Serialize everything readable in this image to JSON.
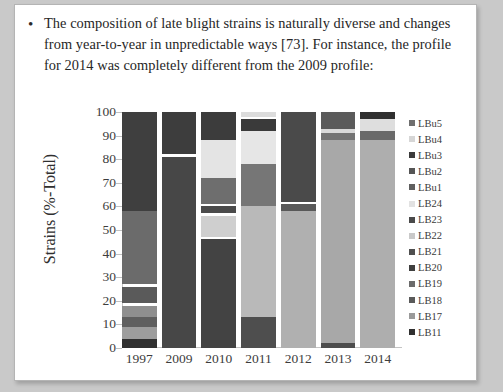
{
  "slide": {
    "bullet_marker": "•",
    "body_text": "The composition of late blight strains is naturally diverse and changes from year-to-year in unpredictable ways [73]. For instance, the profile for 2014 was completely different from the 2009 profile:"
  },
  "chart_data": {
    "type": "bar",
    "stacked": true,
    "stack_mode": "percent",
    "title": "",
    "xlabel": "",
    "ylabel": "Strains (%-Total)",
    "ylim": [
      0,
      100
    ],
    "ytick_labels": [
      "100",
      "90",
      "80",
      "70",
      "60",
      "50",
      "40",
      "30",
      "20",
      "10",
      "0"
    ],
    "yticks": [
      100,
      90,
      80,
      70,
      60,
      50,
      40,
      30,
      20,
      10,
      0
    ],
    "grid": false,
    "legend_position": "right",
    "categories": [
      "1997",
      "2009",
      "2010",
      "2011",
      "2012",
      "2013",
      "2014"
    ],
    "legend_entries": [
      "LBu5",
      "LBu4",
      "LBu3",
      "LBu2",
      "LBu1",
      "LB24",
      "LB23",
      "LB22",
      "LB21",
      "LB20",
      "LB19",
      "LB18",
      "LB17",
      "LB11"
    ],
    "series_colors": {
      "LBu5": "#6f6f6f",
      "LBu4": "#d6d6d6",
      "LBu3": "#3b3b3b",
      "LBu2": "#555555",
      "LBu1": "#5f5f5f",
      "LB24": "#e2e2e2",
      "LB23": "#4a4a4a",
      "LB22": "#c9c9c9",
      "LB21": "#4f4f4f",
      "LB20": "#3f3f3f",
      "LB19": "#6b6b6b",
      "LB18": "#5a5a5a",
      "LB17": "#9a9a9a",
      "LB11": "#303030"
    },
    "series": [
      {
        "name": "LBu5",
        "values": [
          0,
          0,
          0,
          0,
          0,
          9,
          0
        ]
      },
      {
        "name": "LBu4",
        "values": [
          0,
          0,
          0,
          0,
          0,
          0,
          6
        ]
      },
      {
        "name": "LBu3",
        "values": [
          0,
          0,
          0,
          4,
          0,
          0,
          2
        ]
      },
      {
        "name": "LBu2",
        "values": [
          0,
          0,
          0,
          0,
          0,
          0,
          3
        ]
      },
      {
        "name": "LBu1",
        "values": [
          0,
          0,
          12,
          0,
          0,
          0,
          0
        ]
      },
      {
        "name": "LB24",
        "values": [
          0,
          0,
          16,
          17,
          0,
          0,
          0
        ]
      },
      {
        "name": "LB23",
        "values": [
          42,
          18,
          0,
          0,
          42,
          0,
          0
        ]
      },
      {
        "name": "LB22",
        "values": [
          0,
          0,
          0,
          0,
          0,
          0,
          0
        ]
      },
      {
        "name": "LB21",
        "values": [
          0,
          0,
          12,
          17,
          0,
          0,
          0
        ]
      },
      {
        "name": "LB20",
        "values": [
          0,
          82,
          0,
          0,
          0,
          0,
          0
        ]
      },
      {
        "name": "LB19",
        "values": [
          31,
          0,
          0,
          0,
          0,
          0,
          0
        ]
      },
      {
        "name": "LB18",
        "values": [
          0,
          0,
          4,
          0,
          0,
          0,
          0
        ]
      },
      {
        "name": "LB17",
        "values": [
          22,
          0,
          10,
          49,
          58,
          90,
          89
        ]
      },
      {
        "name": "LB11",
        "values": [
          5,
          0,
          46,
          13,
          0,
          1,
          0
        ]
      }
    ],
    "bars": [
      {
        "category": "1997",
        "segments": [
          {
            "series": "LB23",
            "from": 58,
            "to": 100,
            "color": "#3f3f3f"
          },
          {
            "series": "LB19",
            "from": 27,
            "to": 58,
            "color": "#6b6b6b"
          },
          {
            "series": "LB17",
            "from": 19,
            "to": 26,
            "color": "#5a5a5a"
          },
          {
            "series": "LB17",
            "from": 13,
            "to": 18,
            "color": "#8f8f8f"
          },
          {
            "series": "LB17",
            "from": 9,
            "to": 13,
            "color": "#5f5f5f"
          },
          {
            "series": "LB17",
            "from": 4,
            "to": 9,
            "color": "#9d9d9d"
          },
          {
            "series": "LB11",
            "from": 0,
            "to": 4,
            "color": "#303030"
          }
        ]
      },
      {
        "category": "2009",
        "segments": [
          {
            "series": "LB23",
            "from": 82,
            "to": 100,
            "color": "#3d3d3d"
          },
          {
            "series": "LB20",
            "from": 0,
            "to": 81,
            "color": "#474747"
          }
        ]
      },
      {
        "category": "2010",
        "segments": [
          {
            "series": "LBu1",
            "from": 88,
            "to": 100,
            "color": "#3c3c3c"
          },
          {
            "series": "LB24",
            "from": 72,
            "to": 88,
            "color": "#e4e4e4"
          },
          {
            "series": "LB21",
            "from": 61,
            "to": 72,
            "color": "#6e6e6e"
          },
          {
            "series": "LB18",
            "from": 57,
            "to": 60,
            "color": "#4b4b4b"
          },
          {
            "series": "LB17",
            "from": 47,
            "to": 56,
            "color": "#cfcfcf"
          },
          {
            "series": "LB11",
            "from": 0,
            "to": 46,
            "color": "#434343"
          }
        ]
      },
      {
        "category": "2011",
        "segments": [
          {
            "series": "LB24",
            "from": 98,
            "to": 100,
            "color": "#dcdcdc"
          },
          {
            "series": "LBu3",
            "from": 92,
            "to": 97,
            "color": "#3a3a3a"
          },
          {
            "series": "LB24",
            "from": 78,
            "to": 92,
            "color": "#e6e6e6"
          },
          {
            "series": "LB21",
            "from": 60,
            "to": 78,
            "color": "#767676"
          },
          {
            "series": "LB17",
            "from": 13,
            "to": 60,
            "color": "#b9b9b9"
          },
          {
            "series": "LB11",
            "from": 0,
            "to": 13,
            "color": "#4e4e4e"
          }
        ]
      },
      {
        "category": "2012",
        "segments": [
          {
            "series": "LB23",
            "from": 62,
            "to": 100,
            "color": "#4a4a4a"
          },
          {
            "series": "LB23",
            "from": 58,
            "to": 61,
            "color": "#595959"
          },
          {
            "series": "LB17",
            "from": 0,
            "to": 58,
            "color": "#b0b0b0"
          }
        ]
      },
      {
        "category": "2013",
        "segments": [
          {
            "series": "LBu5",
            "from": 93,
            "to": 100,
            "color": "#5b5b5b"
          },
          {
            "series": "LBu5",
            "from": 91,
            "to": 93,
            "color": "#d9d9d9"
          },
          {
            "series": "LBu5",
            "from": 88,
            "to": 91,
            "color": "#737373"
          },
          {
            "series": "LB17",
            "from": 2,
            "to": 88,
            "color": "#a8a8a8"
          },
          {
            "series": "LB11",
            "from": 0,
            "to": 2,
            "color": "#4d4d4d"
          }
        ]
      },
      {
        "category": "2014",
        "segments": [
          {
            "series": "LBu3",
            "from": 97,
            "to": 100,
            "color": "#2f2f2f"
          },
          {
            "series": "LBu4",
            "from": 92,
            "to": 97,
            "color": "#dedede"
          },
          {
            "series": "LBu2",
            "from": 88,
            "to": 92,
            "color": "#6a6a6a"
          },
          {
            "series": "LB17",
            "from": 0,
            "to": 88,
            "color": "#aeaeae"
          }
        ]
      }
    ]
  }
}
